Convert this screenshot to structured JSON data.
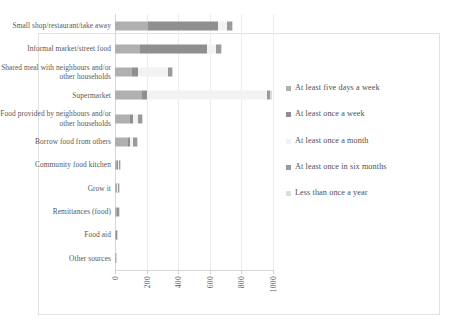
{
  "chart_data": {
    "type": "bar",
    "orientation": "horizontal",
    "stacked": true,
    "title": "",
    "xlabel": "",
    "ylabel": "",
    "xlim": [
      0,
      1000
    ],
    "xticks": [
      "0",
      "200",
      "400",
      "600",
      "800",
      "1000"
    ],
    "grid": true,
    "legend_position": "right",
    "categories": [
      "Small shop/restaurant/take away",
      "Informal market/street food",
      "Shared meal with neighbours and/or other households",
      "Supermarket",
      "Food provided by neighbours and/or other households",
      "Borrow food from others",
      "Community food kitchen",
      "Grow it",
      "Remittances (food)",
      "Food aid",
      "Other sources"
    ],
    "series": [
      {
        "name": "At least five days a week",
        "color": "#b0b0b0",
        "values": [
          210,
          160,
          110,
          170,
          95,
          80,
          14,
          10,
          12,
          8,
          4
        ]
      },
      {
        "name": "At least once a week",
        "color": "#8f8f8f",
        "values": [
          440,
          420,
          35,
          30,
          20,
          14,
          6,
          5,
          5,
          3,
          2
        ]
      },
      {
        "name": "At least once a month",
        "color": "#f2f2f2",
        "values": [
          60,
          60,
          190,
          760,
          30,
          20,
          5,
          5,
          5,
          2,
          2
        ]
      },
      {
        "name": "At least once in six months",
        "color": "#9a9a9a",
        "values": [
          30,
          28,
          26,
          22,
          25,
          24,
          4,
          4,
          4,
          2,
          1
        ]
      },
      {
        "name": "Less than once a year",
        "color": "#dcdcdc",
        "values": [
          10,
          8,
          6,
          10,
          6,
          5,
          3,
          3,
          3,
          2,
          1
        ]
      }
    ]
  },
  "legend": {
    "items": [
      {
        "label": "At least five days a week"
      },
      {
        "label": "At least once a week"
      },
      {
        "label": "At least once a month"
      },
      {
        "label": "At least once in six months"
      },
      {
        "label": "Less than once a year"
      }
    ]
  }
}
